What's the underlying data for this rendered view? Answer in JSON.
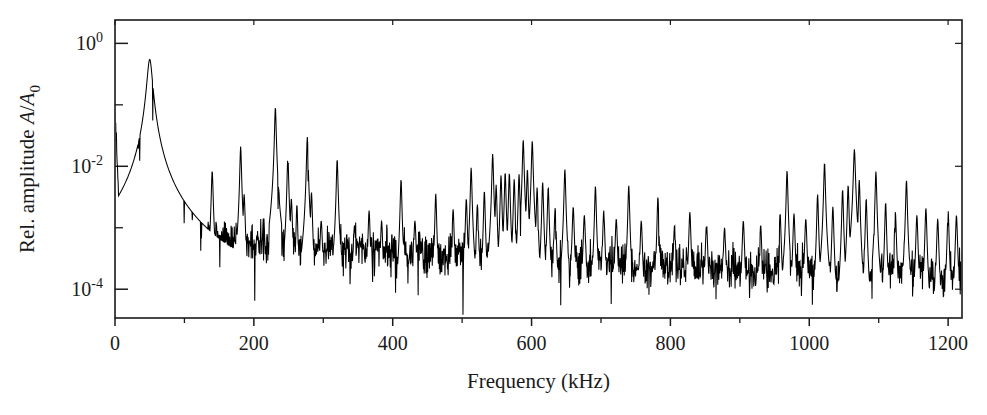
{
  "chart_data": {
    "type": "line",
    "title": "",
    "xlabel": "Frequency (kHz)",
    "ylabel": "Rel. amplitude A/A_0",
    "ylabel_parts": {
      "prefix": "Rel. amplitude ",
      "symbol_a": "A",
      "slash": "/",
      "symbol_a0": "A",
      "sub0": "0"
    },
    "xlim": [
      0,
      1220
    ],
    "ylim": [
      3.4e-05,
      2.4
    ],
    "yscale": "log",
    "xscale": "linear",
    "grid": false,
    "legend": null,
    "xticks_major": [
      0,
      200,
      400,
      600,
      800,
      1000,
      1200
    ],
    "xticklabels": [
      "0",
      "200",
      "400",
      "600",
      "800",
      "1000",
      "1200"
    ],
    "xticks_minor": [
      100,
      300,
      500,
      700,
      900,
      1100
    ],
    "yticks_major": [
      1,
      0.01,
      0.0001
    ],
    "yticklabels": [
      "10^0",
      "10^-2",
      "10^-4"
    ],
    "yticklabel_mantissa": [
      "10",
      "10",
      "10"
    ],
    "yticklabel_exponent": [
      "0",
      "-2",
      "-4"
    ],
    "yticks_minor": [
      0.1,
      0.001
    ],
    "series_name": "spectrum",
    "line_color": "#000000",
    "frame_color": "#1a1a1a",
    "background": "#ffffff",
    "noise_floor_start": 0.0012,
    "noise_floor_end": 0.00016,
    "dc_peak": {
      "f": 0,
      "amp": 0.08
    },
    "main_resonance": {
      "f": 50,
      "amp": 0.55,
      "width": 3.5,
      "label": "fundamental"
    },
    "peaks": [
      {
        "f": 2,
        "amp": 0.012,
        "w": 1.2
      },
      {
        "f": 6,
        "amp": 0.0022,
        "w": 1.5
      },
      {
        "f": 12,
        "amp": 0.0016,
        "w": 2.0
      },
      {
        "f": 20,
        "amp": 0.0019,
        "w": 2.5
      },
      {
        "f": 32,
        "amp": 0.0035,
        "w": 3.0
      },
      {
        "f": 50,
        "amp": 0.55,
        "w": 3.2
      },
      {
        "f": 97,
        "amp": 0.0024,
        "w": 2.0
      },
      {
        "f": 140,
        "amp": 0.0085,
        "w": 1.1
      },
      {
        "f": 181,
        "amp": 0.021,
        "w": 1.0
      },
      {
        "f": 186,
        "amp": 0.0035,
        "w": 1.2
      },
      {
        "f": 214,
        "amp": 0.0016,
        "w": 1.4
      },
      {
        "f": 231,
        "amp": 0.092,
        "w": 1.0
      },
      {
        "f": 236,
        "amp": 0.0042,
        "w": 1.0
      },
      {
        "f": 249,
        "amp": 0.0145,
        "w": 1.0
      },
      {
        "f": 254,
        "amp": 0.003,
        "w": 1.2
      },
      {
        "f": 262,
        "amp": 0.0024,
        "w": 1.0
      },
      {
        "f": 277,
        "amp": 0.03,
        "w": 1.0
      },
      {
        "f": 283,
        "amp": 0.0038,
        "w": 1.1
      },
      {
        "f": 297,
        "amp": 0.0013,
        "w": 1.5
      },
      {
        "f": 320,
        "amp": 0.013,
        "w": 1.0
      },
      {
        "f": 345,
        "amp": 0.0011,
        "w": 1.5
      },
      {
        "f": 366,
        "amp": 0.0019,
        "w": 1.2
      },
      {
        "f": 384,
        "amp": 0.0013,
        "w": 1.3
      },
      {
        "f": 412,
        "amp": 0.0062,
        "w": 1.0
      },
      {
        "f": 432,
        "amp": 0.0013,
        "w": 1.4
      },
      {
        "f": 462,
        "amp": 0.0036,
        "w": 1.0
      },
      {
        "f": 487,
        "amp": 0.002,
        "w": 1.2
      },
      {
        "f": 506,
        "amp": 0.003,
        "w": 1.1
      },
      {
        "f": 513,
        "amp": 0.0095,
        "w": 1.0
      },
      {
        "f": 522,
        "amp": 0.0024,
        "w": 1.2
      },
      {
        "f": 532,
        "amp": 0.004,
        "w": 1.0
      },
      {
        "f": 544,
        "amp": 0.016,
        "w": 1.0
      },
      {
        "f": 549,
        "amp": 0.005,
        "w": 1.0
      },
      {
        "f": 556,
        "amp": 0.0072,
        "w": 1.0
      },
      {
        "f": 562,
        "amp": 0.008,
        "w": 1.0
      },
      {
        "f": 568,
        "amp": 0.0078,
        "w": 1.0
      },
      {
        "f": 575,
        "amp": 0.0062,
        "w": 1.0
      },
      {
        "f": 582,
        "amp": 0.0074,
        "w": 1.0
      },
      {
        "f": 588,
        "amp": 0.027,
        "w": 1.0
      },
      {
        "f": 594,
        "amp": 0.009,
        "w": 1.0
      },
      {
        "f": 601,
        "amp": 0.026,
        "w": 1.0
      },
      {
        "f": 608,
        "amp": 0.0045,
        "w": 1.0
      },
      {
        "f": 616,
        "amp": 0.0055,
        "w": 1.0
      },
      {
        "f": 624,
        "amp": 0.0046,
        "w": 1.0
      },
      {
        "f": 634,
        "amp": 0.0021,
        "w": 1.2
      },
      {
        "f": 648,
        "amp": 0.009,
        "w": 1.0
      },
      {
        "f": 660,
        "amp": 0.0022,
        "w": 1.2
      },
      {
        "f": 676,
        "amp": 0.0016,
        "w": 1.3
      },
      {
        "f": 692,
        "amp": 0.0048,
        "w": 1.0
      },
      {
        "f": 704,
        "amp": 0.0019,
        "w": 1.2
      },
      {
        "f": 722,
        "amp": 0.0014,
        "w": 1.3
      },
      {
        "f": 740,
        "amp": 0.0049,
        "w": 1.0
      },
      {
        "f": 758,
        "amp": 0.0013,
        "w": 1.3
      },
      {
        "f": 782,
        "amp": 0.0032,
        "w": 1.0
      },
      {
        "f": 806,
        "amp": 0.0011,
        "w": 1.4
      },
      {
        "f": 828,
        "amp": 0.0018,
        "w": 1.2
      },
      {
        "f": 852,
        "amp": 0.0012,
        "w": 1.3
      },
      {
        "f": 878,
        "amp": 0.001,
        "w": 1.4
      },
      {
        "f": 905,
        "amp": 0.0013,
        "w": 1.3
      },
      {
        "f": 930,
        "amp": 0.0011,
        "w": 1.3
      },
      {
        "f": 958,
        "amp": 0.0017,
        "w": 1.2
      },
      {
        "f": 968,
        "amp": 0.0085,
        "w": 1.0
      },
      {
        "f": 978,
        "amp": 0.0017,
        "w": 1.2
      },
      {
        "f": 995,
        "amp": 0.0014,
        "w": 1.3
      },
      {
        "f": 1012,
        "amp": 0.0035,
        "w": 1.0
      },
      {
        "f": 1022,
        "amp": 0.0115,
        "w": 1.0
      },
      {
        "f": 1034,
        "amp": 0.0022,
        "w": 1.1
      },
      {
        "f": 1048,
        "amp": 0.0042,
        "w": 1.0
      },
      {
        "f": 1056,
        "amp": 0.005,
        "w": 1.0
      },
      {
        "f": 1065,
        "amp": 0.019,
        "w": 1.2
      },
      {
        "f": 1072,
        "amp": 0.006,
        "w": 1.0
      },
      {
        "f": 1082,
        "amp": 0.003,
        "w": 1.0
      },
      {
        "f": 1096,
        "amp": 0.0082,
        "w": 1.0
      },
      {
        "f": 1110,
        "amp": 0.0026,
        "w": 1.0
      },
      {
        "f": 1124,
        "amp": 0.0018,
        "w": 1.2
      },
      {
        "f": 1140,
        "amp": 0.006,
        "w": 1.0
      },
      {
        "f": 1155,
        "amp": 0.0016,
        "w": 1.2
      },
      {
        "f": 1168,
        "amp": 0.0021,
        "w": 1.1
      },
      {
        "f": 1185,
        "amp": 0.0014,
        "w": 1.2
      },
      {
        "f": 1200,
        "amp": 0.0019,
        "w": 1.1
      },
      {
        "f": 1212,
        "amp": 0.0016,
        "w": 1.2
      }
    ]
  },
  "figure": {
    "plot_left": 115,
    "plot_right": 962,
    "plot_top": 20,
    "plot_bottom": 318,
    "tick_len_major": 8,
    "tick_len_minor": 5
  }
}
